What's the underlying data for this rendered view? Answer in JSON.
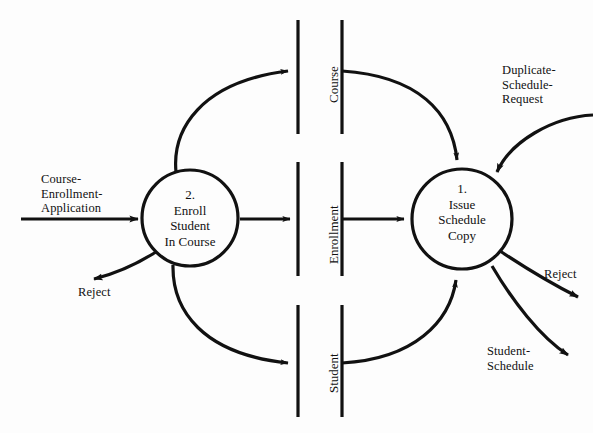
{
  "diagram": {
    "type": "data-flow-diagram",
    "title": "",
    "background_color": "#fdfdfd",
    "stroke_color": "#111111",
    "processes": [
      {
        "id": "process-2",
        "number": "2.",
        "name": "Enroll\nStudent\nIn Course",
        "label": "2.\nEnroll\nStudent\nIn Course",
        "cx": 190,
        "cy": 218,
        "r": 48
      },
      {
        "id": "process-1",
        "number": "1.",
        "name": "Issue\nSchedule\nCopy",
        "label": "1.\nIssue\nSchedule\nCopy",
        "cx": 462,
        "cy": 219,
        "r": 50
      }
    ],
    "data_stores": [
      {
        "id": "store-course",
        "label": "Course",
        "x1": 298,
        "x2": 342,
        "y_top": 20,
        "y_bottom": 134
      },
      {
        "id": "store-enrollment",
        "label": "Enrollment",
        "x1": 298,
        "x2": 342,
        "y_top": 162,
        "y_bottom": 276
      },
      {
        "id": "store-student",
        "label": "Student",
        "x1": 298,
        "x2": 342,
        "y_top": 305,
        "y_bottom": 417
      }
    ],
    "flows": [
      {
        "id": "flow-course-enrollment-application",
        "label": "Course-\nEnrollment-\nApplication",
        "from": "external-left",
        "to": "process-2"
      },
      {
        "id": "flow-reject-left",
        "label": "Reject",
        "from": "process-2",
        "to": "external-left"
      },
      {
        "id": "flow-course",
        "label": "",
        "from": "process-2",
        "to": "store-course"
      },
      {
        "id": "flow-course-read",
        "label": "",
        "from": "store-course",
        "to": "process-1"
      },
      {
        "id": "flow-enrollment-write",
        "label": "",
        "from": "process-2",
        "to": "store-enrollment"
      },
      {
        "id": "flow-enrollment-read",
        "label": "",
        "from": "store-enrollment",
        "to": "process-1"
      },
      {
        "id": "flow-student-write",
        "label": "",
        "from": "process-2",
        "to": "store-student"
      },
      {
        "id": "flow-student-read",
        "label": "",
        "from": "store-student",
        "to": "process-1"
      },
      {
        "id": "flow-duplicate-schedule-request",
        "label": "Duplicate-\nSchedule-\nRequest",
        "from": "external-right",
        "to": "process-1"
      },
      {
        "id": "flow-reject-right",
        "label": "Reject",
        "from": "process-1",
        "to": "external-right"
      },
      {
        "id": "flow-student-schedule",
        "label": "Student-\nSchedule",
        "from": "process-1",
        "to": "external-right"
      }
    ],
    "labels": {
      "course_enrollment_application": "Course-\nEnrollment-\nApplication",
      "reject_left": "Reject",
      "duplicate_schedule_request": "Duplicate-\nSchedule-\nRequest",
      "reject_right": "Reject",
      "student_schedule": "Student-\nSchedule",
      "process_2": "2.\nEnroll\nStudent\nIn Course",
      "process_1": "1.\nIssue\nSchedule\nCopy",
      "store_course": "Course",
      "store_enrollment": "Enrollment",
      "store_student": "Student"
    }
  }
}
